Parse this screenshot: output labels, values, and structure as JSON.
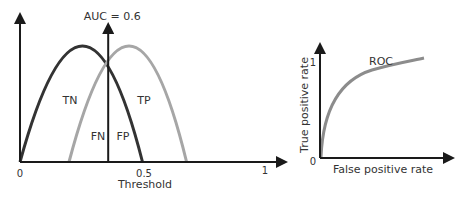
{
  "left_panel": {
    "auc_label": "AUC = 0.6",
    "x_axis_title": "Threshold",
    "x_ticks": [
      "0",
      "0.5",
      "1"
    ],
    "regions": {
      "tn": "TN",
      "tp": "TP",
      "fn": "FN",
      "fp": "FP"
    },
    "threshold_value": 0.36,
    "curves": [
      {
        "name": "negatives-distribution",
        "color": "#333333",
        "start": 0.0,
        "peak": 0.26,
        "end": 0.5
      },
      {
        "name": "positives-distribution",
        "color": "#a6a6a6",
        "start": 0.2,
        "peak": 0.45,
        "end": 0.68
      }
    ]
  },
  "right_panel": {
    "curve_label": "ROC",
    "x_axis_title": "False positive rate",
    "y_axis_title": "True positive rate",
    "y_ticks": [
      "0",
      "1"
    ],
    "curve_color": "#8c8c8c"
  },
  "colors": {
    "axis": "#1a1a1a",
    "dark_curve": "#333333",
    "light_curve": "#a6a6a6",
    "roc_curve": "#8c8c8c"
  }
}
